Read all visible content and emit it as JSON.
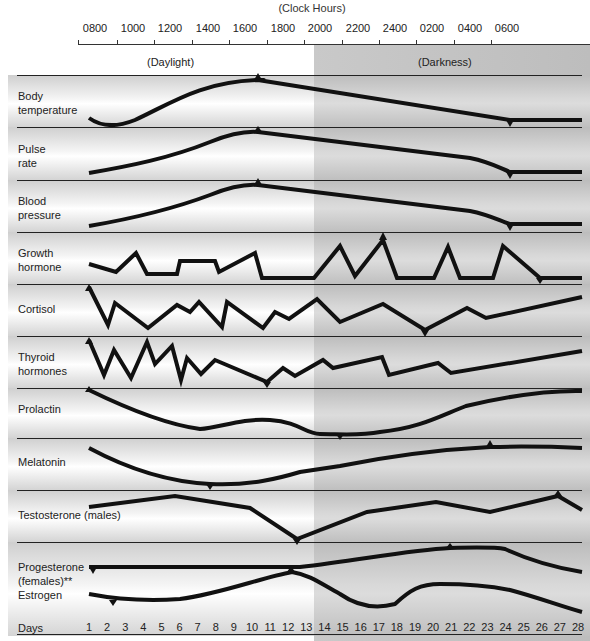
{
  "chart_data": {
    "type": "line",
    "title": "(Clock Hours)",
    "x_top_ticks": [
      "0800",
      "1000",
      "1200",
      "1400",
      "1600",
      "1800",
      "2000",
      "2200",
      "2400",
      "0200",
      "0400",
      "0600"
    ],
    "x_bottom_label": "Days",
    "x_bottom_ticks": [
      "1",
      "2",
      "3",
      "4",
      "5",
      "6",
      "7",
      "8",
      "9",
      "10",
      "11",
      "12",
      "13",
      "14",
      "15",
      "16",
      "17",
      "18",
      "19",
      "20",
      "21",
      "22",
      "23",
      "24",
      "25",
      "26",
      "27",
      "28"
    ],
    "regions": [
      {
        "label": "(Daylight)",
        "from": "0800",
        "to": "1900"
      },
      {
        "label": "(Darkness)",
        "from": "1900",
        "to": "0700"
      }
    ],
    "grid": false,
    "series": [
      {
        "name": "Body temperature",
        "peak": "1600",
        "trough": "0400",
        "shape": "dip near 0900, rise to peak at 1600, decline to low at 0400, flat"
      },
      {
        "name": "Pulse rate",
        "peak": "1600",
        "trough": "0400",
        "shape": "rise from 0800 to peak at 1600, decline to 0400, flat"
      },
      {
        "name": "Blood pressure",
        "peak": "1600",
        "trough": "0400",
        "shape": "rise from 0800 to peak at 1600, decline to 0400, flat"
      },
      {
        "name": "Growth hormone",
        "peak": "2200",
        "shape": "pulsatile; highest peak ~2200"
      },
      {
        "name": "Cortisol",
        "peak": "0800",
        "trough": "2400",
        "shape": "pulsatile; peak at 0800, lowest near 2400"
      },
      {
        "name": "Thyroid hormones",
        "peak": "0800",
        "trough": "1600",
        "shape": "pulsatile; peak at 0800, trough near 1600"
      },
      {
        "name": "Prolactin",
        "peak": "0800",
        "trough": "2000",
        "shape": "decline from 0800, trough ~2000, rises overnight"
      },
      {
        "name": "Melatonin",
        "trough": "1400",
        "peak": "0200",
        "shape": "low in day (trough ~1400), peak ~0200"
      },
      {
        "name": "Testosterone (males)",
        "trough": "1800",
        "peak": "0500",
        "shape": "trough ~1800, peak ~0500"
      },
      {
        "name": "Progesterone (females)**",
        "axis": "days",
        "trough_day": 2,
        "peak_day": 22
      },
      {
        "name": "Estrogen",
        "axis": "days",
        "trough_day": 3,
        "peak_day": 14
      }
    ]
  },
  "header": {
    "title": "(Clock Hours)",
    "daylight_label": "(Daylight)",
    "darkness_label": "(Darkness)"
  },
  "rows": [
    {
      "label_line1": "Body",
      "label_line2": "temperature"
    },
    {
      "label_line1": "Pulse",
      "label_line2": "rate"
    },
    {
      "label_line1": "Blood",
      "label_line2": "pressure"
    },
    {
      "label_line1": "Growth",
      "label_line2": "hormone"
    },
    {
      "label_line1": "Cortisol",
      "label_line2": ""
    },
    {
      "label_line1": "Thyroid",
      "label_line2": "hormones"
    },
    {
      "label_line1": "Prolactin",
      "label_line2": ""
    },
    {
      "label_line1": "Melatonin",
      "label_line2": ""
    },
    {
      "label_line1": "Testosterone (males)",
      "label_line2": ""
    },
    {
      "label_line1": "Progesterone",
      "label_line2": "(females)**",
      "label_line3": "Estrogen"
    }
  ],
  "footer": {
    "days_label": "Days"
  }
}
